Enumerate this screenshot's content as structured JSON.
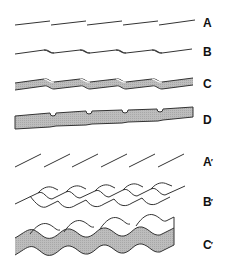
{
  "figure": {
    "rows": [
      {
        "id": "A",
        "label": "A",
        "prime": ""
      },
      {
        "id": "B",
        "label": "B",
        "prime": ""
      },
      {
        "id": "C",
        "label": "C",
        "prime": ""
      },
      {
        "id": "D",
        "label": "D",
        "prime": ""
      },
      {
        "id": "A2",
        "label": "A",
        "prime": "′"
      },
      {
        "id": "B2",
        "label": "B",
        "prime": "′"
      },
      {
        "id": "C2",
        "label": "C",
        "prime": "′"
      }
    ],
    "colors": {
      "stroke": "#333333",
      "fill": "#b5b5b5",
      "label": "#111111"
    }
  }
}
